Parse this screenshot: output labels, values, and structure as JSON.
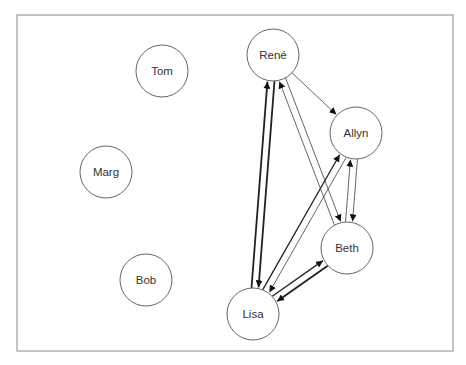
{
  "diagram": {
    "type": "directed-graph",
    "frame": {
      "x": 17,
      "y": 15,
      "width": 436,
      "height": 336
    },
    "node_radius": 26,
    "nodes": [
      {
        "id": "tom",
        "label": "Tom",
        "x": 162,
        "y": 71
      },
      {
        "id": "marg",
        "label": "Marg",
        "x": 106,
        "y": 172
      },
      {
        "id": "bob",
        "label": "Bob",
        "x": 146,
        "y": 280
      },
      {
        "id": "rene",
        "label": "René",
        "x": 273,
        "y": 55
      },
      {
        "id": "allyn",
        "label": "Allyn",
        "x": 356,
        "y": 133
      },
      {
        "id": "beth",
        "label": "Beth",
        "x": 347,
        "y": 248
      },
      {
        "id": "lisa",
        "label": "Lisa",
        "x": 253,
        "y": 314
      }
    ],
    "edges": [
      {
        "from": "rene",
        "to": "lisa",
        "weight": "heavy",
        "offset": -5
      },
      {
        "from": "lisa",
        "to": "rene",
        "weight": "heavy",
        "offset": -5
      },
      {
        "from": "rene",
        "to": "allyn",
        "weight": "light",
        "offset": 0
      },
      {
        "from": "rene",
        "to": "beth",
        "weight": "light",
        "offset": -5
      },
      {
        "from": "beth",
        "to": "rene",
        "weight": "light",
        "offset": -5
      },
      {
        "from": "lisa",
        "to": "allyn",
        "weight": "medium",
        "offset": -5
      },
      {
        "from": "allyn",
        "to": "lisa",
        "weight": "light",
        "offset": -5
      },
      {
        "from": "beth",
        "to": "allyn",
        "weight": "light",
        "offset": -5
      },
      {
        "from": "allyn",
        "to": "beth",
        "weight": "light",
        "offset": -5
      },
      {
        "from": "lisa",
        "to": "beth",
        "weight": "medium",
        "offset": -5
      },
      {
        "from": "beth",
        "to": "lisa",
        "weight": "heavy",
        "offset": -5
      }
    ]
  }
}
